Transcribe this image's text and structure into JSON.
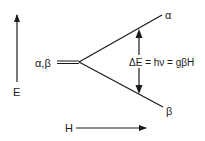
{
  "diagram": {
    "axes": {
      "energy_label": "E",
      "field_label": "H"
    },
    "degenerate_level_label": "α,β",
    "upper_level_label": "α",
    "lower_level_label": "β",
    "transition_equation": "ΔE = hν = gβH",
    "colors": {
      "line": "#1a1a1a",
      "background": "#ffffff"
    }
  }
}
